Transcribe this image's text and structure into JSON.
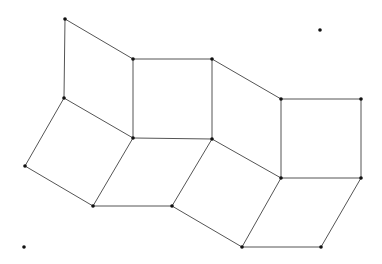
{
  "diagram": {
    "type": "tiling-graph",
    "width": 382,
    "height": 264,
    "colors": {
      "edge": "#555555",
      "vertex": "#111111",
      "background": "#ffffff"
    },
    "vertices": [
      {
        "id": "A",
        "x": 65,
        "y": 19
      },
      {
        "id": "B",
        "x": 133,
        "y": 59
      },
      {
        "id": "C",
        "x": 212,
        "y": 59
      },
      {
        "id": "D",
        "x": 281,
        "y": 99
      },
      {
        "id": "E",
        "x": 361,
        "y": 99
      },
      {
        "id": "F",
        "x": 64,
        "y": 98
      },
      {
        "id": "G",
        "x": 133,
        "y": 138
      },
      {
        "id": "I",
        "x": 212,
        "y": 139
      },
      {
        "id": "J",
        "x": 281,
        "y": 178
      },
      {
        "id": "K",
        "x": 361,
        "y": 178
      },
      {
        "id": "H",
        "x": 25,
        "y": 166
      },
      {
        "id": "L",
        "x": 93,
        "y": 206
      },
      {
        "id": "M",
        "x": 172,
        "y": 206
      },
      {
        "id": "N",
        "x": 242,
        "y": 247
      },
      {
        "id": "O",
        "x": 321,
        "y": 247
      },
      {
        "id": "P",
        "x": 320,
        "y": 30,
        "isolated": true
      },
      {
        "id": "Q",
        "x": 24,
        "y": 247,
        "isolated": true
      }
    ],
    "edges": [
      [
        "A",
        "B"
      ],
      [
        "A",
        "F"
      ],
      [
        "B",
        "G"
      ],
      [
        "F",
        "G"
      ],
      [
        "B",
        "C"
      ],
      [
        "C",
        "I"
      ],
      [
        "G",
        "I"
      ],
      [
        "C",
        "D"
      ],
      [
        "D",
        "J"
      ],
      [
        "I",
        "J"
      ],
      [
        "D",
        "E"
      ],
      [
        "E",
        "K"
      ],
      [
        "J",
        "K"
      ],
      [
        "F",
        "H"
      ],
      [
        "H",
        "L"
      ],
      [
        "G",
        "L"
      ],
      [
        "L",
        "M"
      ],
      [
        "I",
        "M"
      ],
      [
        "M",
        "N"
      ],
      [
        "J",
        "N"
      ],
      [
        "N",
        "O"
      ],
      [
        "K",
        "O"
      ]
    ],
    "faces": [
      {
        "name": "parallelogram-top-1",
        "vertices": [
          "A",
          "B",
          "G",
          "F"
        ]
      },
      {
        "name": "square-top-2",
        "vertices": [
          "B",
          "C",
          "I",
          "G"
        ]
      },
      {
        "name": "parallelogram-top-3",
        "vertices": [
          "C",
          "D",
          "J",
          "I"
        ]
      },
      {
        "name": "square-top-4",
        "vertices": [
          "D",
          "E",
          "K",
          "J"
        ]
      },
      {
        "name": "rhombus-bottom-1",
        "vertices": [
          "F",
          "G",
          "L",
          "H"
        ]
      },
      {
        "name": "rhombus-bottom-2",
        "vertices": [
          "G",
          "I",
          "M",
          "L"
        ]
      },
      {
        "name": "rhombus-bottom-3",
        "vertices": [
          "I",
          "J",
          "N",
          "M"
        ]
      },
      {
        "name": "rhombus-bottom-4",
        "vertices": [
          "J",
          "K",
          "O",
          "N"
        ]
      }
    ]
  }
}
